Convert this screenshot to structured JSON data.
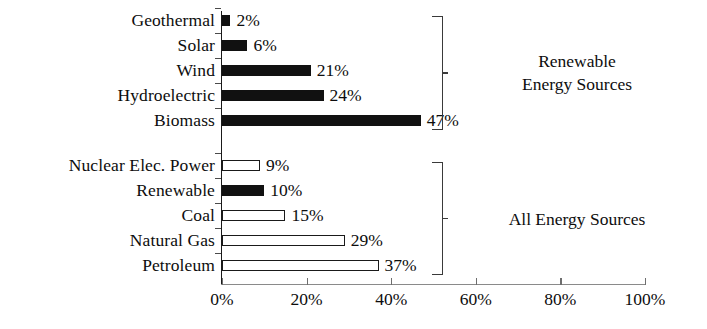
{
  "chart_data": {
    "type": "bar",
    "orientation": "horizontal",
    "title": "",
    "xlabel": "",
    "ylabel": "",
    "xlim": [
      0,
      100
    ],
    "xticks": [
      "0%",
      "20%",
      "40%",
      "60%",
      "80%",
      "100%"
    ],
    "xtick_values": [
      0,
      20,
      40,
      60,
      80,
      100
    ],
    "grid": false,
    "legend": "none",
    "value_label_suffix": "%",
    "groups": [
      {
        "name": "Renewable Energy Sources",
        "label_lines": "Renewable\nEnergy Sources",
        "categories": [
          "Geothermal",
          "Solar",
          "Wind",
          "Hydroelectric",
          "Biomass"
        ],
        "values": [
          2,
          6,
          21,
          24,
          47
        ],
        "value_labels": [
          "2%",
          "6%",
          "21%",
          "24%",
          "47%"
        ],
        "fills": [
          "solid",
          "solid",
          "solid",
          "solid",
          "solid"
        ]
      },
      {
        "name": "All Energy Sources",
        "label_lines": "All Energy Sources",
        "categories": [
          "Nuclear Elec. Power",
          "Renewable",
          "Coal",
          "Natural Gas",
          "Petroleum"
        ],
        "values": [
          9,
          10,
          15,
          29,
          37
        ],
        "value_labels": [
          "9%",
          "10%",
          "15%",
          "29%",
          "37%"
        ],
        "fills": [
          "hollow",
          "solid",
          "hollow",
          "hollow",
          "hollow"
        ]
      }
    ],
    "colors": {
      "solid_fill": "#111111",
      "hollow_fill": "#ffffff",
      "bar_outline": "#1a1a1a",
      "axis": "#1a1a1a",
      "text": "#0d0d0d",
      "bracket": "#3a3a3a",
      "background": "#ffffff"
    }
  },
  "rows": [
    {
      "label": "Geothermal",
      "value_label": "2%",
      "value": 2,
      "fill": "solid",
      "y": 15
    },
    {
      "label": "Solar",
      "value_label": "6%",
      "value": 6,
      "fill": "solid",
      "y": 40
    },
    {
      "label": "Wind",
      "value_label": "21%",
      "value": 21,
      "fill": "solid",
      "y": 65
    },
    {
      "label": "Hydroelectric",
      "value_label": "24%",
      "value": 24,
      "fill": "solid",
      "y": 90
    },
    {
      "label": "Biomass",
      "value_label": "47%",
      "value": 47,
      "fill": "solid",
      "y": 115
    },
    {
      "label": "Nuclear Elec. Power",
      "value_label": "9%",
      "value": 9,
      "fill": "hollow",
      "y": 160
    },
    {
      "label": "Renewable",
      "value_label": "10%",
      "value": 10,
      "fill": "solid",
      "y": 185
    },
    {
      "label": "Coal",
      "value_label": "15%",
      "value": 15,
      "fill": "hollow",
      "y": 210
    },
    {
      "label": "Natural Gas",
      "value_label": "29%",
      "value": 29,
      "fill": "hollow",
      "y": 235
    },
    {
      "label": "Petroleum",
      "value_label": "37%",
      "value": 37,
      "fill": "hollow",
      "y": 260
    }
  ],
  "xticks": [
    {
      "label": "0%",
      "value": 0
    },
    {
      "label": "20%",
      "value": 20
    },
    {
      "label": "40%",
      "value": 40
    },
    {
      "label": "60%",
      "value": 60
    },
    {
      "label": "80%",
      "value": 80
    },
    {
      "label": "100%",
      "value": 100
    }
  ],
  "brackets": [
    {
      "name": "renewable-energy-sources",
      "label": "Renewable\nEnergy Sources",
      "top": 16,
      "height": 114
    },
    {
      "name": "all-energy-sources",
      "label": "All Energy Sources",
      "top": 162,
      "height": 113
    }
  ]
}
